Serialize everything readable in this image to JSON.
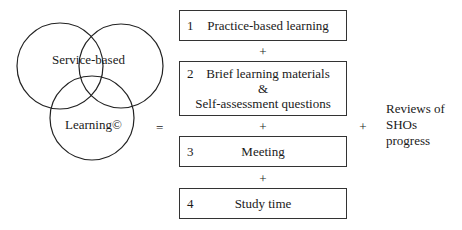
{
  "venn": {
    "circles": [
      {
        "name": "service",
        "cx": 60,
        "cy": 66,
        "r": 43
      },
      {
        "name": "based",
        "cx": 121,
        "cy": 66,
        "r": 42
      },
      {
        "name": "learning",
        "cx": 92,
        "cy": 118,
        "r": 42
      }
    ],
    "label_top": "Service-based",
    "label_bottom": "Learning©"
  },
  "equals": "=",
  "components": [
    {
      "number": "1",
      "text": "Practice-based learning"
    },
    {
      "number": "2",
      "line1": "Brief learning materials",
      "line2": "&",
      "line3": "Self-assessment questions"
    },
    {
      "number": "3",
      "text": "Meeting"
    },
    {
      "number": "4",
      "text": "Study time"
    }
  ],
  "plus": "+",
  "reviews": {
    "line1": "Reviews of",
    "line2": "SHOs",
    "line3": "progress"
  }
}
